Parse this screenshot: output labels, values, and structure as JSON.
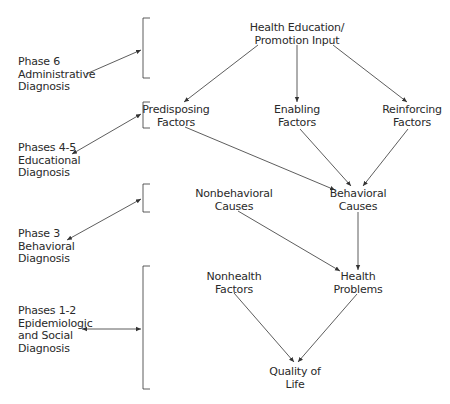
{
  "diagram": {
    "nodes": {
      "input": {
        "line1": "Health Education/",
        "line2": "Promotion Input"
      },
      "predisposing": {
        "line1": "Predisposing",
        "line2": "Factors"
      },
      "enabling": {
        "line1": "Enabling",
        "line2": "Factors"
      },
      "reinforcing": {
        "line1": "Reinforcing",
        "line2": "Factors"
      },
      "nonbehavioral": {
        "line1": "Nonbehavioral",
        "line2": "Causes"
      },
      "behavioral": {
        "line1": "Behavioral",
        "line2": "Causes"
      },
      "nonhealth": {
        "line1": "Nonhealth",
        "line2": "Factors"
      },
      "health_problems": {
        "line1": "Health",
        "line2": "Problems"
      },
      "quality": {
        "line1": "Quality of",
        "line2": "Life"
      }
    },
    "phases": [
      {
        "line1": "Phase 6",
        "line2": "Administrative",
        "line3": "Diagnosis"
      },
      {
        "line1": "Phases 4-5",
        "line2": "Educational",
        "line3": "Diagnosis"
      },
      {
        "line1": "Phase 3",
        "line2": "Behavioral",
        "line3": "Diagnosis"
      },
      {
        "line1": "Phases 1-2",
        "line2": "Epidemiologic",
        "line3": "and Social",
        "line4": "Diagnosis"
      }
    ],
    "colors": {
      "line": "#333333",
      "text": "#2a2a2a",
      "background": "#ffffff"
    }
  }
}
